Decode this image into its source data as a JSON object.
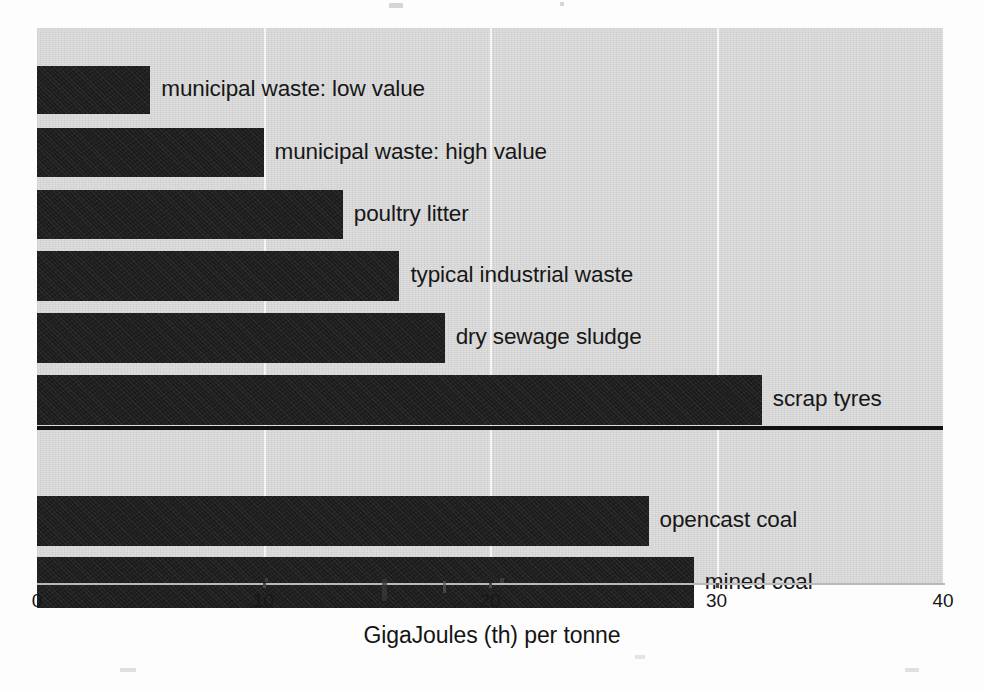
{
  "chart_data": {
    "type": "bar",
    "orientation": "horizontal",
    "title": "",
    "xlabel": "GigaJoules (th) per tonne",
    "ylabel": "",
    "xlim": [
      0,
      40
    ],
    "xticks": [
      0,
      10,
      20,
      30,
      40
    ],
    "xtick_labels": [
      "0",
      "10",
      "20",
      "30",
      "40"
    ],
    "grid": true,
    "grid_axis": "x",
    "legend": "none",
    "bar_color": "#1c1c1c",
    "plot_background": "#dedede",
    "categories": [
      "municipal waste: low value",
      "municipal waste: high value",
      "poultry litter",
      "typical industrial waste",
      "dry sewage sludge",
      "scrap tyres",
      "opencast coal",
      "mined coal"
    ],
    "values": [
      5,
      10,
      13.5,
      16,
      18,
      32,
      27,
      29
    ],
    "groups": [
      {
        "name": "waste fuels",
        "categories": [
          "municipal waste: low value",
          "municipal waste: high value",
          "poultry litter",
          "typical industrial waste",
          "dry sewage sludge",
          "scrap tyres"
        ],
        "values": [
          5,
          10,
          13.5,
          16,
          18,
          32
        ]
      },
      {
        "name": "coal",
        "categories": [
          "opencast coal",
          "mined coal"
        ],
        "values": [
          27,
          29
        ]
      }
    ],
    "annotations": [
      {
        "type": "separator-line",
        "description": "horizontal rule dividing waste fuels from coal"
      }
    ]
  },
  "bars": [
    {
      "label": "municipal waste: low value",
      "value": 5,
      "top": 38,
      "height": 48
    },
    {
      "label": "municipal waste: high value",
      "value": 10,
      "top": 100,
      "height": 49
    },
    {
      "label": "poultry litter",
      "value": 13.5,
      "top": 162,
      "height": 49
    },
    {
      "label": "typical industrial waste",
      "value": 16,
      "top": 223,
      "height": 50
    },
    {
      "label": "dry sewage sludge",
      "value": 18,
      "top": 285,
      "height": 50
    },
    {
      "label": "scrap tyres",
      "value": 32,
      "top": 347,
      "height": 50
    },
    {
      "label": "opencast coal",
      "value": 27,
      "top": 468,
      "height": 50
    },
    {
      "label": "mined coal",
      "value": 29,
      "top": 529,
      "height": 51
    }
  ],
  "axis": {
    "title": "GigaJoules (th) per tonne",
    "ticks": [
      {
        "value": 0,
        "label": "0"
      },
      {
        "value": 10,
        "label": "10"
      },
      {
        "value": 20,
        "label": "20"
      },
      {
        "value": 30,
        "label": "30"
      },
      {
        "value": 40,
        "label": "40"
      }
    ]
  },
  "separator": {
    "top": 426
  }
}
